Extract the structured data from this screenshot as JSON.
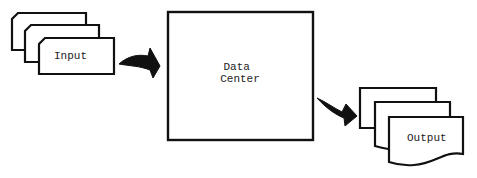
{
  "diagram": {
    "input_label": "Input",
    "center_label_line1": "Data",
    "center_label_line2": "Center",
    "output_label": "Output",
    "stroke_color": "#111111",
    "fill_color": "#ffffff"
  }
}
